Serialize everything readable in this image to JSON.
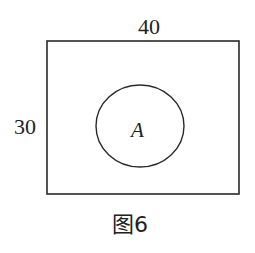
{
  "figure": {
    "caption": "图6",
    "width_label": "40",
    "height_label": "30",
    "region_label": "A",
    "stroke_color": "#2a2a2a"
  }
}
